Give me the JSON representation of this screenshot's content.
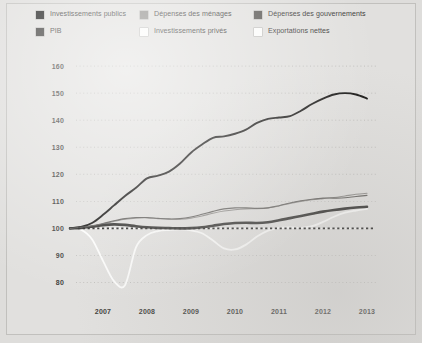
{
  "legend": {
    "items": [
      {
        "label": "Investissements publics",
        "color": "#1a1a1a",
        "col": "c1",
        "row": "r1"
      },
      {
        "label": "Dépenses des ménages",
        "color": "#8d8b88",
        "col": "c2",
        "row": "r1"
      },
      {
        "label": "Dépenses des gouvernements",
        "color": "#585653",
        "col": "c3",
        "row": "r1"
      },
      {
        "label": "PIB",
        "color": "#3a3937",
        "col": "c1",
        "row": "r2"
      },
      {
        "label": "Investissements privés",
        "color": "#fbfbfa",
        "col": "c2",
        "row": "r2"
      },
      {
        "label": "Exportations nettes",
        "color": "#fbfbfa",
        "col": "c3",
        "row": "r2"
      }
    ]
  },
  "chart_data": {
    "type": "line",
    "title": "",
    "xlabel": "",
    "ylabel": "",
    "xlim": [
      2006.25,
      2013.25
    ],
    "ylim": [
      75,
      163
    ],
    "yticks": [
      80,
      90,
      100,
      110,
      120,
      130,
      140,
      150,
      160
    ],
    "xticks": [
      2007,
      2008,
      2009,
      2010,
      2011,
      2012,
      2013
    ],
    "grid": true,
    "gridlines": "horizontal-dotted",
    "legend_position": "top",
    "reference_line": {
      "value": 100,
      "style": "dotted",
      "color": "#1d1c1b"
    },
    "x": [
      2006.25,
      2006.5,
      2006.75,
      2007.0,
      2007.25,
      2007.5,
      2007.75,
      2008.0,
      2008.25,
      2008.5,
      2008.75,
      2009.0,
      2009.25,
      2009.5,
      2009.75,
      2010.0,
      2010.25,
      2010.5,
      2010.75,
      2011.0,
      2011.25,
      2011.5,
      2011.75,
      2012.0,
      2012.25,
      2012.5,
      2012.75,
      2013.0
    ],
    "series": [
      {
        "name": "Investissements publics",
        "color": "#151413",
        "width": 1.9,
        "values": [
          100,
          100.5,
          102,
          105,
          108.5,
          112,
          115,
          118.5,
          119.5,
          121,
          124,
          128,
          131,
          133.5,
          134,
          135,
          136.5,
          139,
          140.5,
          141,
          141.5,
          143.5,
          146,
          148,
          149.5,
          150,
          149.5,
          148
        ]
      },
      {
        "name": "PIB",
        "color": "#2b2a28",
        "width": 2.6,
        "values": [
          100,
          100.2,
          100.6,
          101.2,
          101.5,
          101.3,
          100.8,
          100.4,
          100.2,
          100.1,
          100.0,
          100.1,
          100.4,
          101.0,
          101.6,
          102.0,
          102.1,
          102.0,
          102.3,
          103.0,
          103.8,
          104.6,
          105.4,
          106.2,
          106.8,
          107.3,
          107.7,
          108.0
        ]
      },
      {
        "name": "Dépenses des ménages",
        "color": "#8d8b88",
        "width": 1.1,
        "values": [
          100,
          100.3,
          100.8,
          101.6,
          102.6,
          103.4,
          103.8,
          103.9,
          103.6,
          103.4,
          103.4,
          103.8,
          104.6,
          105.6,
          106.4,
          106.9,
          107.2,
          107.3,
          107.6,
          108.3,
          109.2,
          110.0,
          110.6,
          111.0,
          111.4,
          112.0,
          112.6,
          113.0
        ]
      },
      {
        "name": "Dépenses des gouvernements",
        "color": "#5e5c59",
        "width": 1.1,
        "values": [
          100,
          100.4,
          101.0,
          101.8,
          102.8,
          103.6,
          104.0,
          104.0,
          103.7,
          103.5,
          103.6,
          104.2,
          105.2,
          106.3,
          107.2,
          107.6,
          107.6,
          107.4,
          107.6,
          108.4,
          109.4,
          110.2,
          110.8,
          111.2,
          111.2,
          111.3,
          111.8,
          112.2
        ]
      },
      {
        "name": "Investissements privés",
        "color": "#fcfcfb",
        "width": 1.8,
        "values": [
          100,
          99.5,
          96.0,
          88.0,
          80.5,
          79.0,
          93.0,
          97.5,
          99.0,
          99.4,
          99.6,
          99.3,
          98.2,
          95.5,
          92.6,
          92.2,
          94.0,
          97.0,
          99.2,
          100.2,
          100.4,
          100.2,
          100.8,
          102.4,
          104.3,
          105.8,
          106.6,
          107.2
        ]
      },
      {
        "name": "Exportations nettes",
        "color": "#f7f7f6",
        "width": 1.0,
        "values": [
          100,
          100.0,
          100.0,
          100.0,
          100.0,
          100.0,
          100.0,
          100.0,
          100.0,
          100.0,
          100.0,
          100.0,
          100.0,
          100.0,
          100.0,
          100.0,
          100.0,
          100.0,
          100.0,
          100.0,
          100.0,
          100.0,
          100.0,
          100.0,
          100.0,
          100.0,
          100.0,
          100.0
        ]
      }
    ]
  }
}
